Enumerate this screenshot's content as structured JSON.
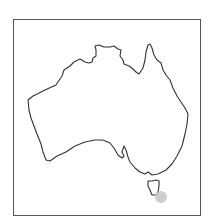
{
  "map": {
    "region": "Australia",
    "style": "outline",
    "border_color": "#555555",
    "coast_color": "#333333",
    "marker": {
      "location": "southeast Tasmania",
      "x": 161,
      "y": 197,
      "radius": 6,
      "color": "#c8c8c8"
    }
  }
}
